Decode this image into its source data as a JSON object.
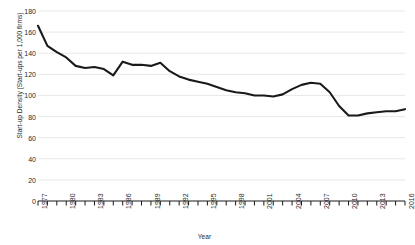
{
  "chart_data": {
    "type": "line",
    "title": "",
    "xlabel": "Year",
    "ylabel": "Start-up Density (Start-ups per 1,000 firms)",
    "ylim": [
      0,
      180
    ],
    "ytick_step": 20,
    "yticks": [
      0,
      20,
      40,
      60,
      80,
      100,
      120,
      140,
      160,
      180
    ],
    "xlim": [
      1977,
      2016
    ],
    "xticks_labeled": [
      1977,
      1980,
      1983,
      1986,
      1989,
      1992,
      1995,
      1998,
      2001,
      2004,
      2007,
      2010,
      2013,
      2016
    ],
    "grid": "horizontal",
    "legend": "none",
    "line_color": "#1a1a1a",
    "x": [
      1977,
      1978,
      1979,
      1980,
      1981,
      1982,
      1983,
      1984,
      1985,
      1986,
      1987,
      1988,
      1989,
      1990,
      1991,
      1992,
      1993,
      1994,
      1995,
      1996,
      1997,
      1998,
      1999,
      2000,
      2001,
      2002,
      2003,
      2004,
      2005,
      2006,
      2007,
      2008,
      2009,
      2010,
      2011,
      2012,
      2013,
      2014,
      2015,
      2016
    ],
    "series": [
      {
        "name": "Start-up Density",
        "values": [
          166,
          147,
          141,
          136,
          128,
          126,
          127,
          125,
          119,
          132,
          129,
          129,
          128,
          131,
          123,
          118,
          115,
          113,
          111,
          108,
          105,
          103,
          102,
          100,
          100,
          99,
          101,
          106,
          110,
          112,
          111,
          103,
          90,
          81,
          81,
          83,
          84,
          85,
          85,
          87
        ]
      }
    ]
  },
  "axis": {
    "ytick_labels": [
      "180",
      "160",
      "140",
      "120",
      "100",
      "80",
      "60",
      "40",
      "20",
      "0"
    ],
    "xtick_labels": [
      "1977",
      "1980",
      "1983",
      "1986",
      "1989",
      "1992",
      "1995",
      "1998",
      "2001",
      "2004",
      "2007",
      "2010",
      "2013",
      "2016"
    ],
    "x_title": "Year",
    "y_title": "Start-up Density (Start-ups per 1,000 firms)"
  },
  "clipped_header": {
    "text": ""
  }
}
